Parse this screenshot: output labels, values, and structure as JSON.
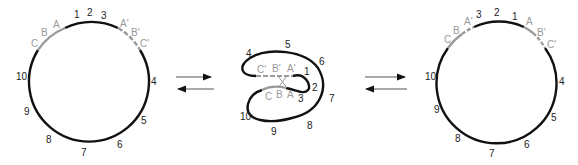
{
  "panels": [
    {
      "id": "left",
      "numbers": [
        "1",
        "2",
        "3",
        "4",
        "5",
        "6",
        "7",
        "8",
        "9",
        "10"
      ],
      "left_arc_labels": [
        "C",
        "B",
        "A"
      ],
      "right_arc_labels": [
        "A'",
        "B'",
        "C'"
      ]
    },
    {
      "id": "middle",
      "numbers": [
        "1",
        "2",
        "3",
        "4",
        "5",
        "6",
        "7",
        "8",
        "9",
        "10"
      ],
      "upper_labels": [
        "C'",
        "B'",
        "A'"
      ],
      "lower_labels": [
        "C",
        "B",
        "A"
      ]
    },
    {
      "id": "right",
      "top_numbers": [
        "3",
        "2",
        "1"
      ],
      "numbers": [
        "4",
        "5",
        "6",
        "7",
        "8",
        "9",
        "10"
      ],
      "left_arc_labels": [
        "C",
        "B",
        "A'"
      ],
      "right_arc_labels": [
        "A",
        "B'",
        "C'"
      ]
    }
  ],
  "arrows": {
    "between_left_middle": [
      "right-arrow",
      "left-arrow"
    ],
    "between_middle_right": [
      "right-arrow",
      "left-arrow"
    ]
  },
  "colors": {
    "strand": "#111111",
    "homology": "#9a9a9a"
  }
}
